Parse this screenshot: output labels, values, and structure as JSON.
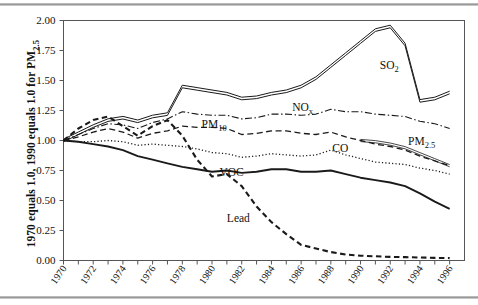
{
  "figure": {
    "y_axis_title": "1970 equals 1.0, 1990 equals 1.0 for PM",
    "y_axis_title_sub": "2.5"
  },
  "chart_data": {
    "type": "line",
    "title": "",
    "xlabel": "",
    "ylabel": "1970 equals 1.0, 1990 equals 1.0 for PM2.5",
    "xlim": [
      1970,
      1997
    ],
    "ylim": [
      0.0,
      2.0
    ],
    "yticks": [
      0.0,
      0.25,
      0.5,
      0.75,
      1.0,
      1.25,
      1.5,
      1.75,
      2.0
    ],
    "ytick_labels": [
      "0.00",
      "0.25",
      "0.50",
      "0.75",
      "1.00",
      "1.25",
      "1.50",
      "1.75",
      "2.00"
    ],
    "xticks": [
      1970,
      1971,
      1972,
      1973,
      1974,
      1975,
      1976,
      1977,
      1978,
      1979,
      1980,
      1981,
      1982,
      1983,
      1984,
      1985,
      1986,
      1987,
      1988,
      1989,
      1990,
      1991,
      1992,
      1993,
      1994,
      1995,
      1996
    ],
    "xtick_labels": [
      "1970",
      "1972",
      "1974",
      "1976",
      "1978",
      "1980",
      "1982",
      "1984",
      "1986",
      "1988",
      "1990",
      "1992",
      "1994",
      "1996"
    ],
    "xtick_labels_years": [
      1970,
      1972,
      1974,
      1976,
      1978,
      1980,
      1982,
      1984,
      1986,
      1988,
      1990,
      1992,
      1994,
      1996
    ],
    "grid": false,
    "legend_position": "inline-annotations",
    "x": [
      1970,
      1971,
      1972,
      1973,
      1974,
      1975,
      1976,
      1977,
      1978,
      1979,
      1980,
      1981,
      1982,
      1983,
      1984,
      1985,
      1986,
      1987,
      1988,
      1989,
      1990,
      1991,
      1992,
      1993,
      1994,
      1995,
      1996
    ],
    "series": [
      {
        "name": "SO2",
        "label": "SO",
        "label_sub": "2",
        "style": "double-solid",
        "label_x": 1991.3,
        "label_y": 1.6,
        "values": [
          1.0,
          1.06,
          1.12,
          1.17,
          1.19,
          1.16,
          1.2,
          1.22,
          1.45,
          1.43,
          1.41,
          1.39,
          1.35,
          1.36,
          1.39,
          1.41,
          1.45,
          1.52,
          1.62,
          1.72,
          1.82,
          1.92,
          1.95,
          1.8,
          1.33,
          1.35,
          1.4
        ]
      },
      {
        "name": "NOx",
        "label": "NO",
        "label_sub": "x",
        "style": "dashdot",
        "label_x": 1985.4,
        "label_y": 1.245,
        "values": [
          1.0,
          1.05,
          1.1,
          1.14,
          1.13,
          1.1,
          1.15,
          1.18,
          1.24,
          1.22,
          1.21,
          1.21,
          1.18,
          1.19,
          1.22,
          1.22,
          1.21,
          1.22,
          1.26,
          1.24,
          1.24,
          1.22,
          1.21,
          1.2,
          1.16,
          1.14,
          1.1
        ]
      },
      {
        "name": "PM10",
        "label": "PM",
        "label_sub": "10",
        "style": "dashed",
        "label_x": 1979.3,
        "label_y": 1.105,
        "values": [
          1.0,
          1.03,
          1.07,
          1.1,
          1.07,
          1.02,
          1.06,
          1.08,
          1.12,
          1.11,
          1.11,
          1.1,
          1.05,
          1.06,
          1.08,
          1.08,
          1.06,
          1.05,
          1.07,
          1.03,
          1.0,
          0.97,
          0.95,
          0.92,
          0.87,
          0.83,
          0.79
        ]
      },
      {
        "name": "PM2.5",
        "label": "PM",
        "label_sub": "2.5",
        "style": "thin-double",
        "label_x": 1993.2,
        "label_y": 0.965,
        "values": [
          null,
          null,
          null,
          null,
          null,
          null,
          null,
          null,
          null,
          null,
          null,
          null,
          null,
          null,
          null,
          null,
          null,
          null,
          null,
          null,
          1.0,
          0.99,
          0.97,
          0.94,
          0.89,
          0.84,
          0.79
        ]
      },
      {
        "name": "CO",
        "label": "CO",
        "label_sub": "",
        "style": "dotted",
        "label_x": 1988.1,
        "label_y": 0.905,
        "values": [
          1.0,
          0.99,
          0.99,
          1.0,
          0.99,
          0.96,
          0.97,
          0.96,
          0.95,
          0.93,
          0.9,
          0.89,
          0.86,
          0.87,
          0.89,
          0.88,
          0.87,
          0.88,
          0.92,
          0.88,
          0.85,
          0.82,
          0.81,
          0.8,
          0.77,
          0.75,
          0.72
        ]
      },
      {
        "name": "VOC",
        "label": "VOC",
        "label_sub": "",
        "style": "thick-solid",
        "label_x": 1980.5,
        "label_y": 0.705,
        "values": [
          1.0,
          0.99,
          0.97,
          0.95,
          0.92,
          0.87,
          0.84,
          0.81,
          0.78,
          0.76,
          0.74,
          0.75,
          0.73,
          0.74,
          0.76,
          0.76,
          0.74,
          0.74,
          0.75,
          0.72,
          0.69,
          0.67,
          0.65,
          0.62,
          0.56,
          0.49,
          0.43
        ]
      },
      {
        "name": "Lead",
        "label": "Lead",
        "label_sub": "",
        "style": "heavy-dashed",
        "label_x": 1981.0,
        "label_y": 0.325,
        "values": [
          1.0,
          1.1,
          1.17,
          1.2,
          1.12,
          1.04,
          1.12,
          1.17,
          1.04,
          0.84,
          0.7,
          0.72,
          0.62,
          0.45,
          0.32,
          0.22,
          0.13,
          0.1,
          0.07,
          0.05,
          0.04,
          0.035,
          0.03,
          0.028,
          0.025,
          0.022,
          0.02
        ]
      }
    ]
  }
}
